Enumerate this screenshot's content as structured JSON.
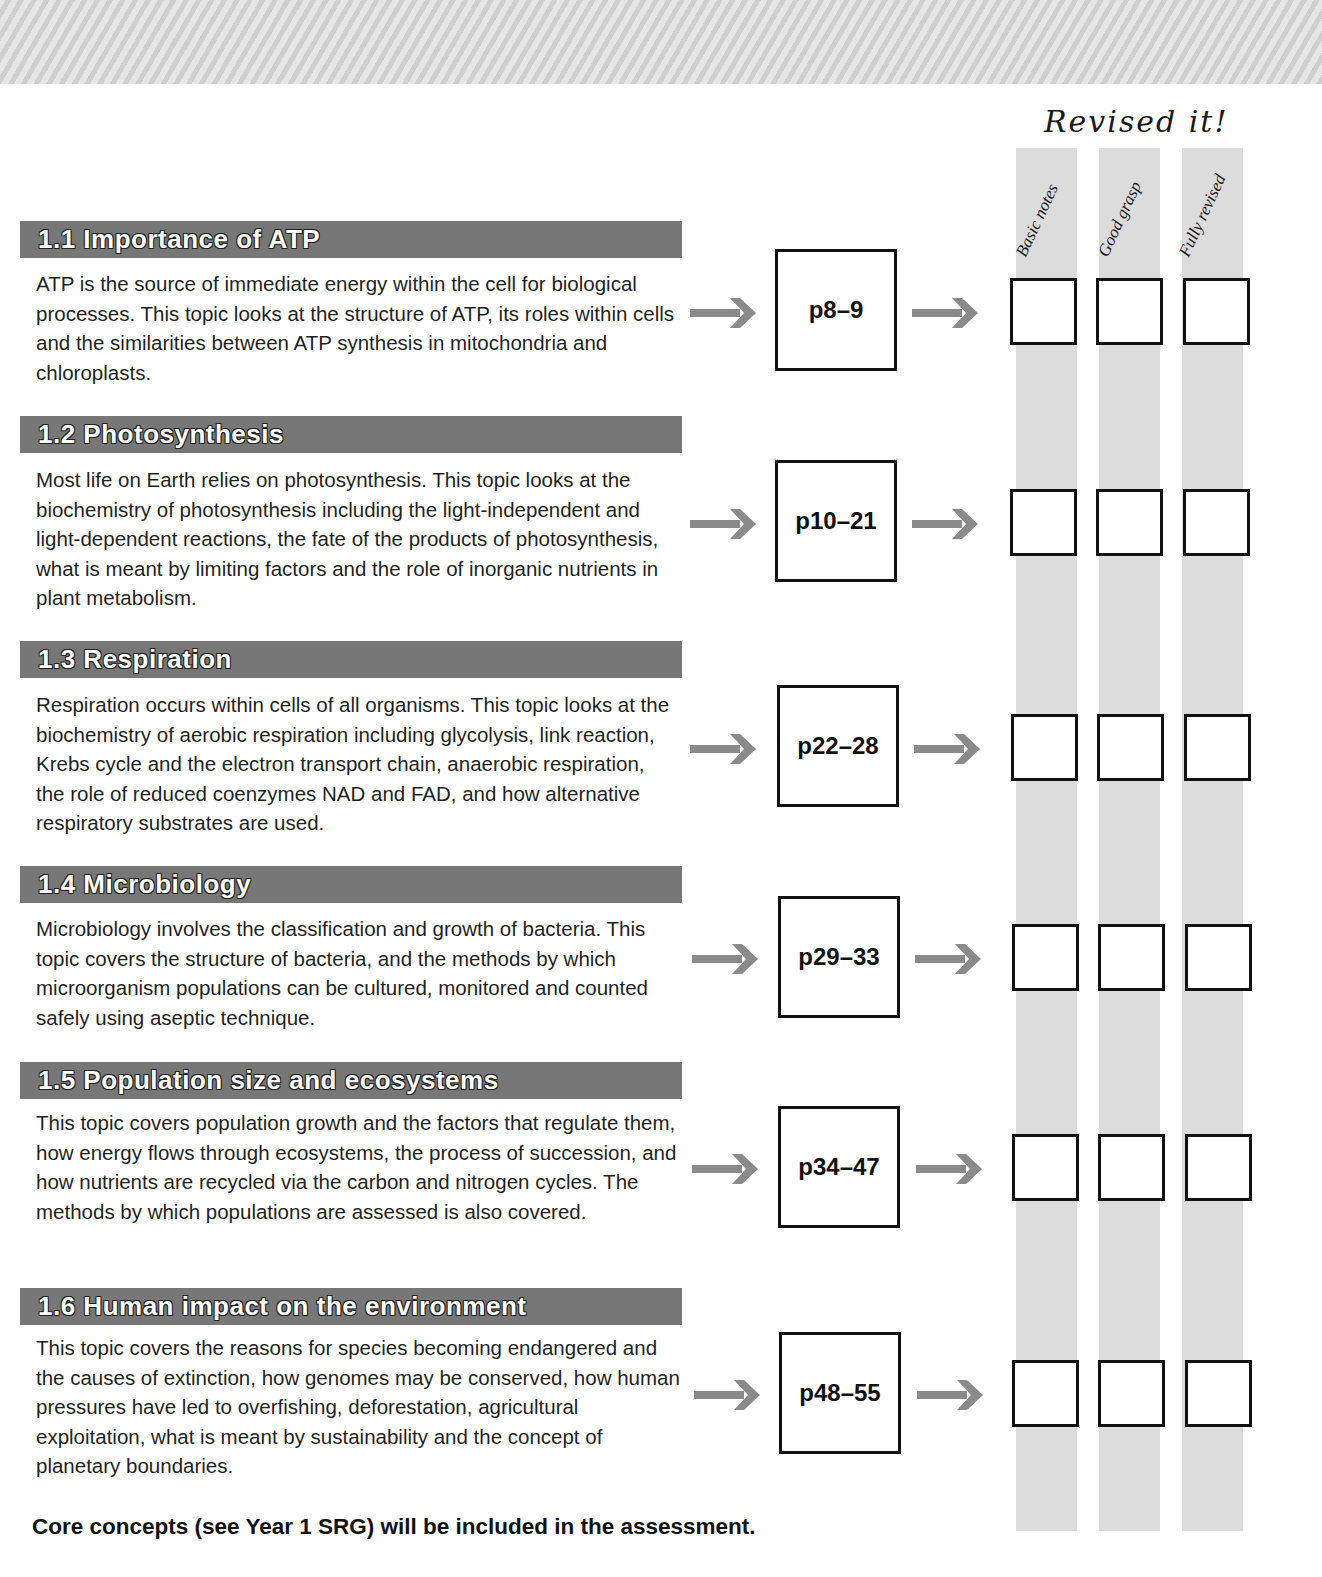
{
  "tracker": {
    "title": "Revised it!",
    "columns": [
      "Basic notes",
      "Good grasp",
      "Fully revised"
    ]
  },
  "sections": [
    {
      "heading": "1.1 Importance of ATP",
      "body": "ATP is the source of immediate energy within the cell for biological processes. This topic looks at the structure of ATP, its roles within cells and the similarities between ATP synthesis in mitochondria and chloroplasts.",
      "pages": "p8–9"
    },
    {
      "heading": "1.2 Photosynthesis",
      "body": "Most life on Earth relies on photosynthesis. This topic looks at the biochemistry of photosynthesis including the light-independent and light-dependent reactions, the fate of the products of photosynthesis, what is meant by limiting factors and the role of inorganic nutrients in plant metabolism.",
      "pages": "p10–21"
    },
    {
      "heading": "1.3 Respiration",
      "body": "Respiration occurs within cells of all organisms. This topic looks at the biochemistry of aerobic respiration including glycolysis, link reaction, Krebs cycle and the electron transport chain, anaerobic respiration, the role of reduced coenzymes NAD and FAD, and how alternative respiratory substrates are used.",
      "pages": "p22–28"
    },
    {
      "heading": "1.4 Microbiology",
      "body": "Microbiology involves the classification and growth of bacteria. This topic covers the structure of bacteria, and the methods by which microorganism populations can be cultured, monitored and counted safely using aseptic technique.",
      "pages": "p29–33"
    },
    {
      "heading": "1.5 Population size and ecosystems",
      "body": "This topic covers population growth and the factors that regulate them, how energy flows through ecosystems, the process of succession, and how nutrients are recycled via the carbon and nitrogen cycles. The methods by which populations are assessed is also covered.",
      "pages": "p34–47"
    },
    {
      "heading": "1.6 Human impact on the environment",
      "body": "This topic covers the reasons for species becoming endangered and the causes of extinction, how genomes may be conserved, how human pressures have led to overfishing, deforestation, agricultural exploitation, what is meant by sustainability and the concept of planetary boundaries.",
      "pages": "p48–55"
    }
  ],
  "footer": {
    "note": "Core concepts (see Year 1 SRG) will be included in the assessment."
  },
  "icons": {
    "arrow": "arrow-right-icon"
  },
  "colors": {
    "header_bar": "#777777",
    "stripe": "#dcdcdc",
    "arrow": "#8a8a8a"
  }
}
